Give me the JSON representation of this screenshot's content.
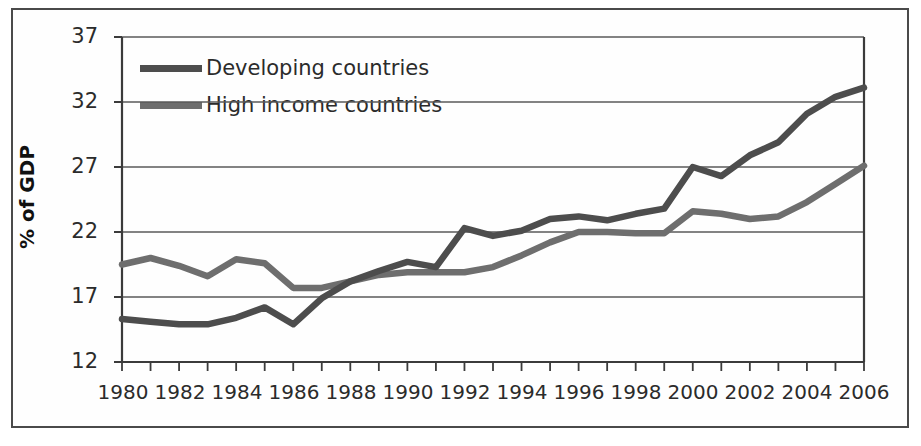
{
  "chart_data": {
    "type": "line",
    "title": "",
    "xlabel": "",
    "ylabel": "% of GDP",
    "xlim": [
      1980,
      2006
    ],
    "ylim": [
      12,
      37
    ],
    "yticks": [
      12,
      17,
      22,
      27,
      32,
      37
    ],
    "xticks": [
      1980,
      1982,
      1984,
      1986,
      1988,
      1990,
      1992,
      1994,
      1996,
      1998,
      2000,
      2002,
      2004,
      2006
    ],
    "x_tick_labels": [
      "1980",
      "1982",
      "1984",
      "1986",
      "1988",
      "1990",
      "1992",
      "1994",
      "1996",
      "1998",
      "2000",
      "2002",
      "2004",
      "2006"
    ],
    "y_tick_labels": [
      "12",
      "17",
      "22",
      "27",
      "32",
      "37"
    ],
    "grid": true,
    "grid_axis": "y",
    "legend_position": "upper-left-inside",
    "x": [
      1980,
      1981,
      1982,
      1983,
      1984,
      1985,
      1986,
      1987,
      1988,
      1989,
      1990,
      1991,
      1992,
      1993,
      1994,
      1995,
      1996,
      1997,
      1998,
      1999,
      2000,
      2001,
      2002,
      2003,
      2004,
      2005,
      2006
    ],
    "series": [
      {
        "name": "Developing countries",
        "color": "#4d4d4d",
        "values": [
          15.3,
          15.1,
          14.9,
          14.9,
          15.4,
          16.2,
          14.9,
          16.9,
          18.2,
          19.0,
          19.7,
          19.3,
          22.3,
          21.7,
          22.1,
          23.0,
          23.2,
          22.9,
          23.4,
          23.8,
          27.0,
          26.3,
          27.9,
          28.9,
          31.1,
          32.4,
          33.1
        ]
      },
      {
        "name": "High income countries",
        "color": "#6e6e6e",
        "values": [
          19.5,
          20.0,
          19.4,
          18.6,
          19.9,
          19.6,
          17.7,
          17.7,
          18.2,
          18.7,
          18.9,
          18.9,
          18.9,
          19.3,
          20.2,
          21.2,
          22.0,
          22.0,
          21.9,
          21.9,
          23.6,
          23.4,
          23.0,
          23.2,
          24.3,
          25.7,
          27.1
        ]
      }
    ]
  },
  "legend": {
    "items": [
      {
        "label": "Developing countries",
        "color": "#4d4d4d"
      },
      {
        "label": "High income countries",
        "color": "#6e6e6e"
      }
    ]
  },
  "axes": {
    "y_title": "% of GDP"
  }
}
